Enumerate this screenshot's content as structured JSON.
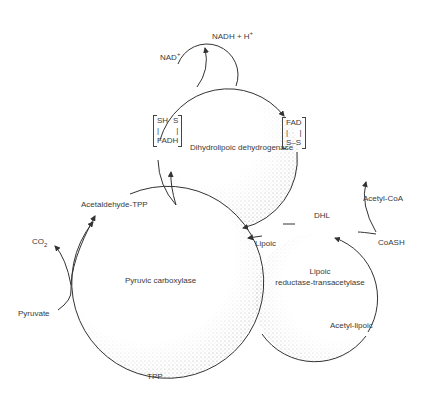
{
  "diagram": {
    "type": "enzyme-cycle",
    "enzymes": {
      "pyruvic_carboxylase": "Pyruvic carboxylase",
      "dihydrolipoic_dehydrogenase": "Dihydrolipoic dehydrogenase",
      "lipoic_transacetylase_line1": "Lipoic",
      "lipoic_transacetylase_line2": "reductase-transacetylase"
    },
    "metabolites": {
      "nadh": "NADH + H",
      "nadh_sup": "+",
      "nad": "NAD",
      "nad_sup": "+",
      "co2": "CO",
      "co2_sub": "2",
      "pyruvate": "Pyruvate",
      "acetaldehyde_tpp": "Acetaldehyde-TPP",
      "tpp": "TPP",
      "lipoic": "Lipoic",
      "dhl": "DHL",
      "acetyl_coa": "Acetyl-CoA",
      "coash": "CoASH",
      "acetyl_lipoic": "Acetyl-lipoic"
    },
    "cofactor_reduced": {
      "top_left": "SH",
      "top_right": "S",
      "bottom": "FADH"
    },
    "cofactor_oxidized": {
      "top": "FAD",
      "bottom": "S–S"
    },
    "colors": {
      "line": "#333333",
      "stipple": "#9a9a9a",
      "text": "#3a3a3a",
      "background": "#ffffff"
    }
  }
}
